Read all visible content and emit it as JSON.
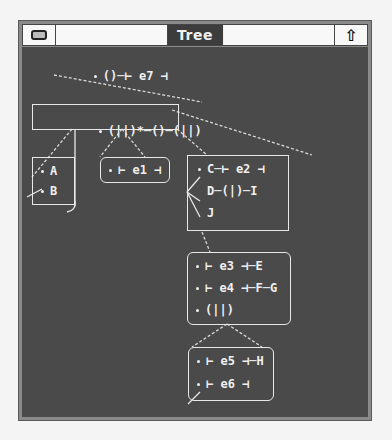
{
  "window": {
    "title": "Tree",
    "minimize_icon": "minimize-icon",
    "resize_icon": "up-arrow-icon",
    "resize_glyph": "⇧"
  },
  "colors": {
    "desktop": "#f4f4f4",
    "frame": "#8a8a8a",
    "content_bg": "#4a4a4a",
    "title_bg": "#3c3c3c",
    "node_fg": "#f0f0f0"
  },
  "tree": {
    "root": {
      "rows": [
        "()─⊢ e7 ⊣"
      ]
    },
    "level1": {
      "rows": [
        "(||)*─()─(||)"
      ]
    },
    "box_ab": {
      "rows": [
        "A",
        "B"
      ]
    },
    "box_e1": {
      "rows": [
        "⊢ e1 ⊣"
      ]
    },
    "box_cdj": {
      "rows": [
        "C─⊢ e2 ⊣",
        "D─(|)─I",
        "J"
      ]
    },
    "box_e3": {
      "rows": [
        "⊢ e3 ⊣─E",
        "⊢ e4 ⊣─F─G",
        "(||)"
      ]
    },
    "box_e5": {
      "rows": [
        "⊢ e5 ⊣─H",
        "⊢ e6 ⊣"
      ]
    }
  }
}
